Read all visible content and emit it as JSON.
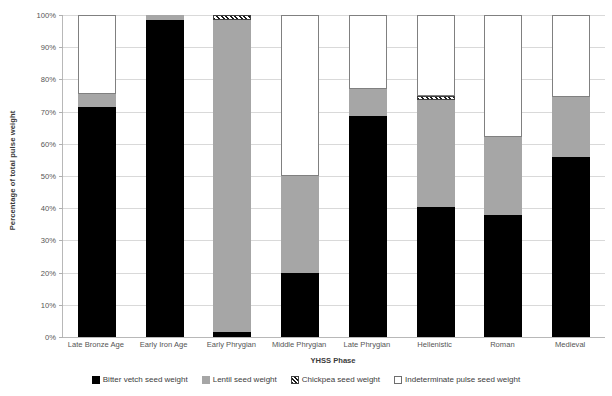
{
  "chart_data": {
    "type": "bar",
    "subtype": "stacked-bar-100-percent",
    "title": "",
    "xlabel": "YHSS Phase",
    "ylabel": "Percentage of total pulse weight",
    "ylim": [
      0,
      100
    ],
    "ytick_labels": [
      "0%",
      "10%",
      "20%",
      "30%",
      "40%",
      "50%",
      "60%",
      "70%",
      "80%",
      "90%",
      "100%"
    ],
    "ytick_values": [
      0,
      10,
      20,
      30,
      40,
      50,
      60,
      70,
      80,
      90,
      100
    ],
    "grid": true,
    "legend_position": "bottom",
    "categories": [
      "Late Bronze Age",
      "Early Iron Age",
      "Early Phrygian",
      "Middle Phrygian",
      "Late Phrygian",
      "Hellenistic",
      "Roman",
      "Medieval"
    ],
    "series": [
      {
        "name": "Bitter vetch seed weight",
        "color": "#000000",
        "pattern": "solid",
        "values": [
          71.5,
          98.5,
          1.5,
          20,
          68.5,
          40.5,
          38,
          56
        ]
      },
      {
        "name": "Lentil seed weight",
        "color": "#a6a6a6",
        "pattern": "solid",
        "values": [
          4,
          1.5,
          97,
          30,
          8.5,
          33,
          24,
          18.5
        ]
      },
      {
        "name": "Chickpea seed weight",
        "color": "#1a1a1a",
        "pattern": "diagonal-hatch",
        "values": [
          0,
          0,
          1.5,
          0,
          0,
          1.5,
          0,
          0
        ]
      },
      {
        "name": "Indeterminate pulse seed weight",
        "color": "#ffffff",
        "pattern": "outline",
        "values": [
          24.5,
          0,
          0,
          50,
          23,
          25,
          38,
          25.5
        ]
      }
    ]
  }
}
